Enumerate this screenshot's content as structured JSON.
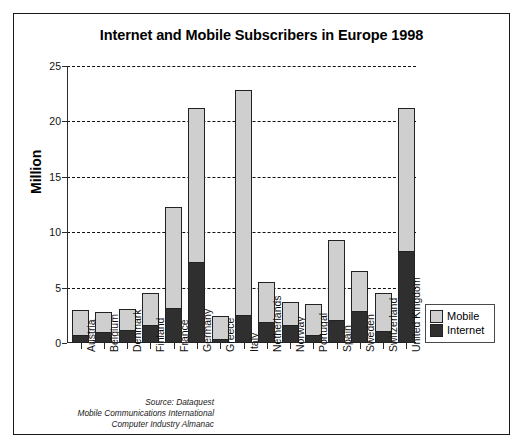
{
  "chart_data": {
    "type": "bar",
    "subtype": "stacked",
    "title": "Internet and Mobile Subscribers in Europe 1998",
    "xlabel": "",
    "ylabel": "Million",
    "ylim": [
      0,
      25
    ],
    "yticks": [
      0,
      5,
      10,
      15,
      20,
      25
    ],
    "grid": "horizontal-dashed",
    "legend_position": "right-bottom-outside",
    "categories": [
      "Austria",
      "Belgium",
      "Denmark",
      "Finland",
      "France",
      "Germany",
      "Greece",
      "Italy",
      "Netherlands",
      "Norway",
      "Portugal",
      "Spain",
      "Sweden",
      "Switzerland",
      "United Kingdom"
    ],
    "series": [
      {
        "name": "Internet",
        "color": "#2f2f2f",
        "values": [
          0.7,
          1.0,
          1.2,
          1.6,
          3.2,
          7.3,
          0.4,
          2.5,
          1.9,
          1.6,
          0.7,
          2.1,
          2.9,
          1.1,
          8.3
        ]
      },
      {
        "name": "Mobile",
        "color": "#cfcfcf",
        "values": [
          2.3,
          1.8,
          1.9,
          2.9,
          9.1,
          13.9,
          2.0,
          20.3,
          3.6,
          2.1,
          2.8,
          7.2,
          3.6,
          3.4,
          12.9
        ]
      }
    ],
    "totals": [
      3.0,
      2.8,
      3.1,
      4.5,
      12.3,
      21.2,
      2.4,
      22.8,
      5.5,
      3.7,
      3.5,
      9.3,
      6.5,
      4.5,
      21.2
    ],
    "source_lines": [
      "Source: Dataquest",
      "Mobile Communications International",
      "Computer Industry Almanac"
    ]
  },
  "legend": {
    "items": [
      {
        "label": "Mobile",
        "color": "#cfcfcf"
      },
      {
        "label": "Internet",
        "color": "#2f2f2f"
      }
    ]
  }
}
